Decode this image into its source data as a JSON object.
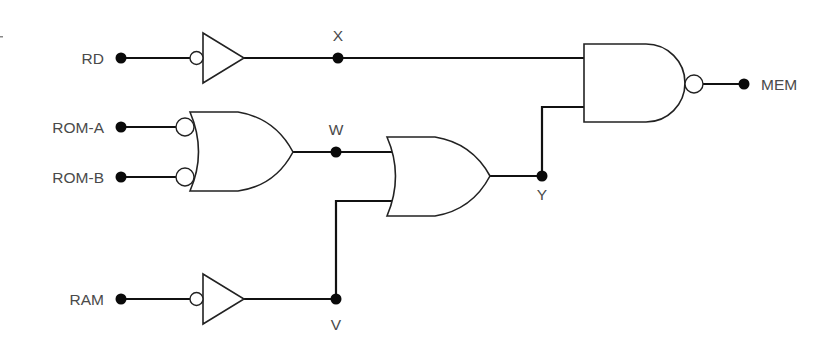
{
  "diagram": {
    "type": "logic-circuit",
    "colors": {
      "wire": "#111111",
      "gate_stroke": "#222222",
      "label": "#4a4a4a",
      "background": "#ffffff"
    },
    "inputs": [
      {
        "id": "rd",
        "label": "RD",
        "y": 58
      },
      {
        "id": "rom_a",
        "label": "ROM-A",
        "y": 127
      },
      {
        "id": "rom_b",
        "label": "ROM-B",
        "y": 177
      },
      {
        "id": "ram",
        "label": "RAM",
        "y": 299
      }
    ],
    "outputs": [
      {
        "id": "mem",
        "label": "MEM"
      }
    ],
    "nodes": {
      "x": {
        "label": "X"
      },
      "w": {
        "label": "W"
      },
      "y": {
        "label": "Y"
      },
      "v": {
        "label": "V"
      }
    },
    "gates": [
      {
        "id": "inv_rd",
        "kind": "inverter (bubble-input buffer)",
        "inputs": [
          "RD"
        ],
        "output": "X"
      },
      {
        "id": "or_rom",
        "kind": "OR with inverted inputs",
        "inputs": [
          "ROM-A",
          "ROM-B"
        ],
        "output": "W"
      },
      {
        "id": "inv_ram",
        "kind": "inverter (bubble-input buffer)",
        "inputs": [
          "RAM"
        ],
        "output": "V"
      },
      {
        "id": "or_wv",
        "kind": "OR",
        "inputs": [
          "W",
          "V"
        ],
        "output": "Y"
      },
      {
        "id": "nand_mem",
        "kind": "NAND",
        "inputs": [
          "X",
          "Y"
        ],
        "output": "MEM"
      }
    ]
  }
}
